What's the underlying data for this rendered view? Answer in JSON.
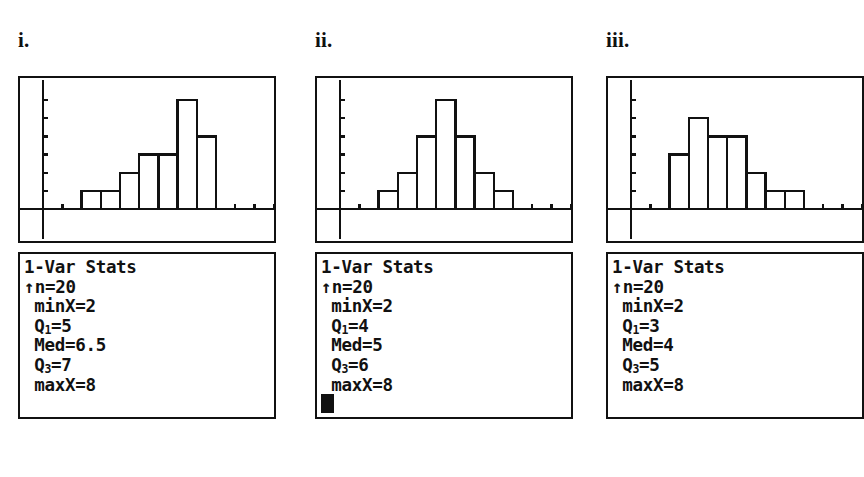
{
  "page": {
    "background": "#ffffff",
    "ink": "#111111",
    "top_cropped_text": "                                           "
  },
  "panels": [
    {
      "label": "i.",
      "stats": {
        "title": "1-Var Stats",
        "lines": [
          {
            "arrow": true,
            "text": "n=20"
          },
          {
            "arrow": false,
            "text": " minX=2"
          },
          {
            "arrow": false,
            "text": " Q",
            "sub": "1",
            "tail": "=5"
          },
          {
            "arrow": false,
            "text": " Med=6.5"
          },
          {
            "arrow": false,
            "text": " Q",
            "sub": "3",
            "tail": "=7"
          },
          {
            "arrow": false,
            "text": " maxX=8"
          }
        ],
        "cursor_visible": false
      }
    },
    {
      "label": "ii.",
      "stats": {
        "title": "1-Var Stats",
        "lines": [
          {
            "arrow": true,
            "text": "n=20"
          },
          {
            "arrow": false,
            "text": " minX=2"
          },
          {
            "arrow": false,
            "text": " Q",
            "sub": "1",
            "tail": "=4"
          },
          {
            "arrow": false,
            "text": " Med=5"
          },
          {
            "arrow": false,
            "text": " Q",
            "sub": "3",
            "tail": "=6"
          },
          {
            "arrow": false,
            "text": " maxX=8"
          }
        ],
        "cursor_visible": true
      }
    },
    {
      "label": "iii.",
      "stats": {
        "title": "1-Var Stats",
        "lines": [
          {
            "arrow": true,
            "text": "n=20"
          },
          {
            "arrow": false,
            "text": " minX=2"
          },
          {
            "arrow": false,
            "text": " Q",
            "sub": "1",
            "tail": "=3"
          },
          {
            "arrow": false,
            "text": " Med=4"
          },
          {
            "arrow": false,
            "text": " Q",
            "sub": "3",
            "tail": "=5"
          },
          {
            "arrow": false,
            "text": " maxX=8"
          }
        ],
        "cursor_visible": false
      }
    }
  ],
  "chart_data": [
    {
      "type": "bar",
      "title": "i.",
      "shape": "left-skewed",
      "categories": [
        "2",
        "3",
        "4",
        "5",
        "6",
        "7",
        "8"
      ],
      "values": [
        1,
        1,
        2,
        3,
        3,
        6,
        4
      ],
      "xlabel": "",
      "ylabel": "",
      "ylim": [
        0,
        7
      ],
      "xlim": [
        0,
        12
      ],
      "grid": false,
      "legend": "none",
      "n": 20,
      "minX": 2,
      "Q1": 5,
      "Med": 6.5,
      "Q3": 7,
      "maxX": 8
    },
    {
      "type": "bar",
      "title": "ii.",
      "shape": "symmetric",
      "categories": [
        "2",
        "3",
        "4",
        "5",
        "6",
        "7",
        "8"
      ],
      "values": [
        1,
        2,
        4,
        6,
        4,
        2,
        1
      ],
      "xlabel": "",
      "ylabel": "",
      "ylim": [
        0,
        7
      ],
      "xlim": [
        0,
        12
      ],
      "grid": false,
      "legend": "none",
      "n": 20,
      "minX": 2,
      "Q1": 4,
      "Med": 5,
      "Q3": 6,
      "maxX": 8
    },
    {
      "type": "bar",
      "title": "iii.",
      "shape": "right-skewed",
      "categories": [
        "2",
        "3",
        "4",
        "5",
        "6",
        "7",
        "8"
      ],
      "values": [
        3,
        5,
        4,
        4,
        2,
        1,
        1
      ],
      "xlabel": "",
      "ylabel": "",
      "ylim": [
        0,
        7
      ],
      "xlim": [
        0,
        12
      ],
      "grid": false,
      "legend": "none",
      "n": 20,
      "minX": 2,
      "Q1": 3,
      "Med": 4,
      "Q3": 5,
      "maxX": 8
    }
  ]
}
